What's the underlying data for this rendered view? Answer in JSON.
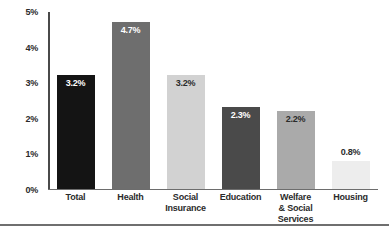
{
  "chart_data": {
    "type": "bar",
    "title": "",
    "subtitle": "",
    "xlabel": "",
    "ylabel": "",
    "categories": [
      "Total",
      "Health",
      "Social Insurance",
      "Education",
      "Welfare & Social Services",
      "Housing"
    ],
    "category_lines": [
      [
        "Total"
      ],
      [
        "Health"
      ],
      [
        "Social",
        "Insurance"
      ],
      [
        "Education"
      ],
      [
        "Welfare",
        "& Social",
        "Services"
      ],
      [
        "Housing"
      ]
    ],
    "values": [
      3.2,
      4.7,
      3.2,
      2.3,
      2.2,
      0.8
    ],
    "data_labels": [
      "3.2%",
      "4.7%",
      "3.2%",
      "2.3%",
      "2.2%",
      "0.8%"
    ],
    "label_positions": [
      "inside",
      "inside",
      "inside",
      "inside",
      "inside",
      "outside"
    ],
    "bar_colors": [
      "#141414",
      "#6e6e6e",
      "#d2d2d2",
      "#4a4a4a",
      "#aaaaaa",
      "#ededed"
    ],
    "label_colors": [
      "#ffffff",
      "#ffffff",
      "#2b2b2b",
      "#ffffff",
      "#2b2b2b",
      "#2b2b2b"
    ],
    "ylim": [
      0,
      5
    ],
    "yticks": [
      0,
      1,
      2,
      3,
      4,
      5
    ],
    "ytick_labels": [
      "0%",
      "1%",
      "2%",
      "3%",
      "4%",
      "5%"
    ],
    "grid": false,
    "legend": null,
    "axis_color": "#4a4a4a",
    "background": "#ffffff"
  }
}
